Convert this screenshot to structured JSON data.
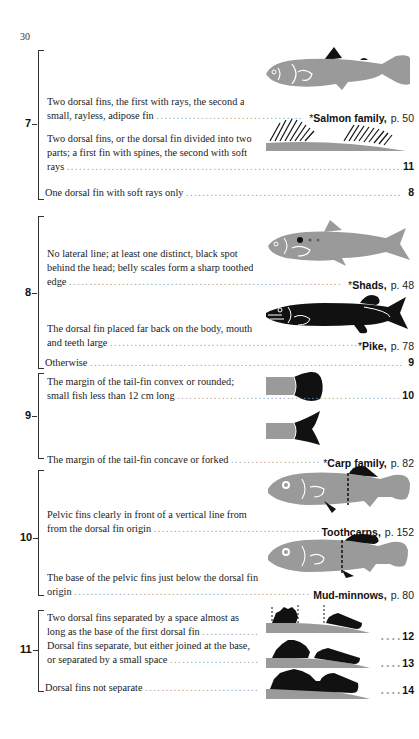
{
  "page": {
    "number": "30"
  },
  "colors": {
    "fish_grey": "#9a9a9a",
    "fish_black": "#111111",
    "outline_white": "#ffffff"
  },
  "couplets": [
    {
      "number": "7",
      "entries": [
        {
          "text": "Two dorsal fins, the first with rays, the second a small, rayless, adipose fin",
          "asterisk": "*",
          "result": "Salmon family,",
          "page_ref": "p. 50",
          "illustration": "salmon-fish"
        },
        {
          "text": "Two dorsal fins, or the dorsal fin divided into two parts; a first fin with spines, the second with soft rays",
          "goto": "11",
          "illustration": "spiny-dorsal-fins"
        },
        {
          "text": "One dorsal fin with soft rays only",
          "goto": "8"
        }
      ]
    },
    {
      "number": "8",
      "entries": [
        {
          "text": "No lateral line; at least one distinct, black spot behind the head; belly scales form a sharp toothed edge",
          "asterisk": "*",
          "result": "Shads,",
          "page_ref": "p. 48",
          "illustration": "shad-fish"
        },
        {
          "text": "The dorsal fin placed far back on the body, mouth and teeth large",
          "asterisk": "*",
          "result": "Pike,",
          "page_ref": "p. 78",
          "illustration": "pike-fish"
        },
        {
          "text": "Otherwise",
          "goto": "9"
        }
      ]
    },
    {
      "number": "9",
      "entries": [
        {
          "text": "The margin of the tail-fin convex or rounded; small fish less than 12 cm long",
          "goto": "10",
          "illustration": "rounded-tail"
        },
        {
          "text": "The margin of the tail-fin concave or forked",
          "asterisk": "*",
          "result": "Carp family,",
          "page_ref": "p. 82",
          "illustration": "forked-tail"
        }
      ]
    },
    {
      "number": "10",
      "entries": [
        {
          "text": "Pelvic fins clearly in front of a vertical line from from the dorsal fin origin",
          "result": "Toothcarps,",
          "page_ref": "p. 152",
          "illustration": "toothcarp-fish"
        },
        {
          "text": "The base of the pelvic fins just below the dorsal fin origin",
          "result": "Mud-minnows,",
          "page_ref": "p. 80",
          "illustration": "mudminnow-fish"
        }
      ]
    },
    {
      "number": "11",
      "entries": [
        {
          "text": "Two dorsal fins separated by a space almost as long as the base of the first dorsal fin",
          "goto": "12",
          "illustration": "fins-separated-wide"
        },
        {
          "text": "Dorsal fins separate, but either joined at the base, or separated by a small space",
          "goto": "13",
          "illustration": "fins-separated-small"
        },
        {
          "text": "Dorsal fins not separate",
          "goto": "14",
          "illustration": "fins-joined"
        }
      ]
    }
  ],
  "lines": {
    "c7e1_l1": "Two dorsal fins, the first with rays, the second a",
    "c7e1_l2": "small, rayless, adipose fin",
    "c7e2_l1": "Two dorsal fins, or the dorsal fin divided into two",
    "c7e2_l2": "parts; a first fin with spines, the second with soft",
    "c7e2_l3": "rays",
    "c7e3_l1": "One dorsal fin with soft rays only",
    "c8e1_l1": "No lateral line; at least one distinct, black spot",
    "c8e1_l2": "behind the head; belly scales form a sharp toothed",
    "c8e1_l3": "edge",
    "c8e2_l1": "The dorsal fin placed far back on the body, mouth",
    "c8e2_l2": "and teeth large",
    "c8e3_l1": "Otherwise",
    "c9e1_l1": "The margin of the tail-fin convex or rounded;",
    "c9e1_l2": "small fish less than 12 cm long",
    "c9e2_l1": "The margin of the tail-fin concave or forked",
    "c10e1_l1": "Pelvic fins clearly in front of a vertical line from",
    "c10e1_l2": "from the dorsal fin origin",
    "c10e2_l1": "The base of the pelvic fins just below the dorsal fin",
    "c10e2_l2": "origin",
    "c11e1_l1": "Two dorsal fins separated by a space almost as",
    "c11e1_l2": "long as the base of the first dorsal fin",
    "c11e2_l1": "Dorsal fins separate, but either joined at the base,",
    "c11e2_l2": "or separated by a small space",
    "c11e3_l1": "Dorsal fins not separate"
  },
  "dots": "........................................................................................................"
}
